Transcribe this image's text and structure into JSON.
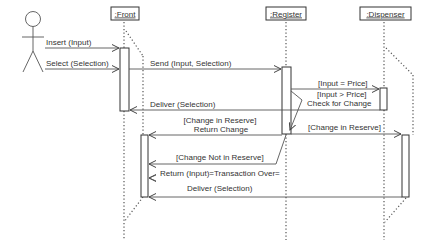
{
  "diagram": {
    "type": "UML sequence diagram",
    "actor": {
      "label": ""
    },
    "objects": [
      {
        "id": "front",
        "label": ":Front"
      },
      {
        "id": "register",
        "label": ":Register"
      },
      {
        "id": "dispenser",
        "label": ":Dispenser"
      }
    ],
    "messages": [
      {
        "from": "actor",
        "to": "front",
        "label": "Insert (Input)"
      },
      {
        "from": "actor",
        "to": "front",
        "label": "Select (Selection)"
      },
      {
        "from": "front",
        "to": "register",
        "label": "Send (Input, Selection)"
      },
      {
        "from": "register",
        "to": "dispenser",
        "label": "[Input = Price]"
      },
      {
        "from": "register",
        "to": "register",
        "label_line1": "[Input > Price]",
        "label_line2": "Check for Change"
      },
      {
        "from": "dispenser",
        "to": "front",
        "label": "Deliver (Selection)"
      },
      {
        "from": "register",
        "to": "front",
        "label_line1": "[Change in Reserve]",
        "label_line2": "Return Change"
      },
      {
        "from": "register",
        "to": "dispenser",
        "label": "[Change in Reserve]"
      },
      {
        "from": "register",
        "to": "front",
        "label": "[Change Not in Reserve]"
      },
      {
        "from": "register",
        "to": "front",
        "label": "Return (Input)=Transaction Over="
      },
      {
        "from": "dispenser",
        "to": "front",
        "label": "Deliver (Selection)"
      }
    ]
  }
}
